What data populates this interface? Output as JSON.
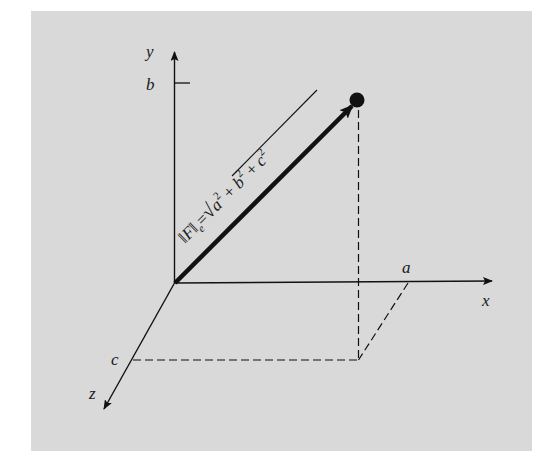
{
  "figure": {
    "background_color": "#d9d9d9",
    "ink_color": "#111111",
    "axes": {
      "x": {
        "label": "x"
      },
      "y": {
        "label": "y"
      },
      "z": {
        "label": "z"
      }
    },
    "intercepts": {
      "a": "a",
      "b": "b",
      "c": "c"
    },
    "formula": {
      "norm_bars_open": "‖",
      "F": "F",
      "norm_bars_close": "‖",
      "subscript": "e",
      "equals": "=",
      "radical": "√",
      "term_a": "a",
      "term_b": "b",
      "term_c": "c",
      "exponent": "2",
      "plus": "+"
    }
  }
}
